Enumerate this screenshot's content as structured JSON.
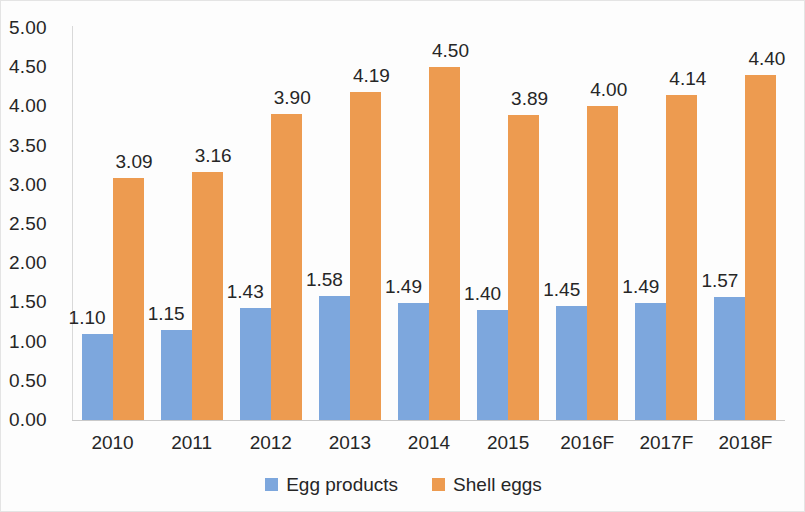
{
  "chart_data": {
    "type": "bar",
    "title": "",
    "subtitle": "",
    "xlabel": "",
    "ylabel": "",
    "categories": [
      "2010",
      "2011",
      "2012",
      "2013",
      "2014",
      "2015",
      "2016F",
      "2017F",
      "2018F"
    ],
    "series": [
      {
        "name": "Egg products",
        "color": "#7da7dd",
        "values": [
          1.1,
          1.15,
          1.43,
          1.58,
          1.49,
          1.4,
          1.45,
          1.49,
          1.57
        ],
        "labels": [
          "1.10",
          "1.15",
          "1.43",
          "1.58",
          "1.49",
          "1.40",
          "1.45",
          "1.49",
          "1.57"
        ]
      },
      {
        "name": "Shell eggs",
        "color": "#ed9b50",
        "values": [
          3.09,
          3.16,
          3.9,
          4.19,
          4.5,
          3.89,
          4.0,
          4.14,
          4.4
        ],
        "labels": [
          "3.09",
          "3.16",
          "3.90",
          "4.19",
          "4.50",
          "3.89",
          "4.00",
          "4.14",
          "4.40"
        ]
      }
    ],
    "ylim": [
      0,
      5.0
    ],
    "ytick_step": 0.5,
    "ytick_labels": [
      "5.00",
      "4.50",
      "4.00",
      "3.50",
      "3.00",
      "2.50",
      "2.00",
      "1.50",
      "1.00",
      "0.50",
      "0.00"
    ],
    "ytick_values": [
      5.0,
      4.5,
      4.0,
      3.5,
      3.0,
      2.5,
      2.0,
      1.5,
      1.0,
      0.5,
      0.0
    ],
    "grid": false,
    "legend_position": "bottom",
    "legend": [
      "Egg products",
      "Shell eggs"
    ],
    "data_labels_shown": true
  }
}
